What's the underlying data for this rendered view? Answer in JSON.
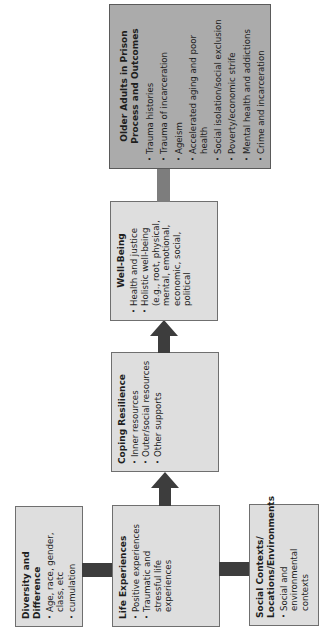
{
  "diagram": {
    "orientation": "rotated -90 degrees (reads bottom-to-top)",
    "colors": {
      "box_fill": "#dedede",
      "outcome_box_fill": "#ababab",
      "box_border": "#6f6f6f",
      "arrow": "#3d3d3d",
      "outcome_connector": "#7d7d7d"
    },
    "boxes": {
      "diversity": {
        "title": "Diversity and Difference",
        "items": [
          "Age, race, gender, class, etc",
          "cumulation"
        ]
      },
      "life": {
        "title": "Life Experiences",
        "items": [
          "Positive experiences",
          "Traumatic and stressful life experiences"
        ]
      },
      "social": {
        "title": "Social Contexts/ Locations/Environments",
        "items": [
          "Social and environmental contexts"
        ]
      },
      "coping": {
        "title": "Coping Resilience",
        "items": [
          "Inner resources",
          "Outer/social resources",
          "Other supports"
        ]
      },
      "wellbeing": {
        "title": "Well-Being",
        "items": [
          "Health and justice",
          "Holistic well-being (e.g., root, physical, mental, emotional, economic, social, political"
        ]
      },
      "outcomes": {
        "title": "Older Adults in Prison Process and Outcomes",
        "items": [
          "Trauma histories",
          "Trauma of incarceration",
          "Ageism",
          "Accelerated aging and poor health",
          "Social isolation/social exclusion",
          "Poverty/economic strife",
          "Mental health and addictions",
          "Crime and incarceration"
        ]
      }
    },
    "links": [
      {
        "from": "diversity",
        "to": "life",
        "type": "line"
      },
      {
        "from": "social",
        "to": "life",
        "type": "line"
      },
      {
        "from": "life",
        "to": "coping",
        "type": "arrow"
      },
      {
        "from": "coping",
        "to": "wellbeing",
        "type": "arrow"
      },
      {
        "from": "wellbeing",
        "to": "outcomes",
        "type": "line"
      }
    ]
  }
}
